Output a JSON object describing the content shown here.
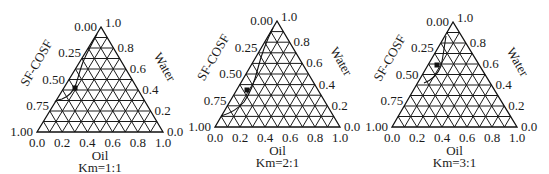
{
  "chart_data": [
    {
      "type": "ternary",
      "title": "Km=1:1",
      "axes": {
        "left": "SF-COSF",
        "right": "Water",
        "bottom": "Oil"
      },
      "ticks": {
        "left": [
          "0.00",
          "0.25",
          "0.50",
          "0.75",
          "1.00"
        ],
        "right": [
          "1.0",
          "0.8",
          "0.6",
          "0.4",
          "0.2",
          "0.0"
        ],
        "bottom": [
          "0.0",
          "0.2",
          "0.4",
          "0.6",
          "0.8",
          "1.0"
        ]
      },
      "grid_divisions": 10,
      "marker": {
        "sf_cosf": 0.6,
        "water": 0.38,
        "oil": 0.02
      },
      "phase_boundary": "curve near left edge from apex to SF-COSF≈0.7"
    },
    {
      "type": "ternary",
      "title": "Km=2:1",
      "axes": {
        "left": "SF-COSF",
        "right": "Water",
        "bottom": "Oil"
      },
      "ticks": {
        "left": [
          "0.00",
          "0.25",
          "0.50",
          "0.75",
          "1.00"
        ],
        "right": [
          "1.0",
          "0.8",
          "0.6",
          "0.4",
          "0.2",
          "0.0"
        ],
        "bottom": [
          "0.0",
          "0.2",
          "0.4",
          "0.6",
          "0.8",
          "1.0"
        ]
      },
      "grid_divisions": 10,
      "marker": {
        "sf_cosf": 0.58,
        "water": 0.36,
        "oil": 0.06
      },
      "phase_boundary": "curve from apex to SF-COSF≈0.9"
    },
    {
      "type": "ternary",
      "title": "Km=3:1",
      "axes": {
        "left": "SF-COSF",
        "right": "Water",
        "bottom": "Oil"
      },
      "ticks": {
        "left": [
          "0.00",
          "0.25",
          "0.50",
          "0.75",
          "1.00"
        ],
        "right": [
          "1.0",
          "0.8",
          "0.6",
          "0.4",
          "0.2",
          "0.0"
        ],
        "bottom": [
          "0.0",
          "0.2",
          "0.4",
          "0.6",
          "0.8",
          "1.0"
        ]
      },
      "grid_divisions": 10,
      "marker": {
        "sf_cosf": 0.38,
        "water": 0.58,
        "oil": 0.04
      },
      "phase_boundary": "short arc near left edge between SF-COSF≈0.2 and ≈0.45"
    }
  ],
  "diagrams": [
    {
      "title": "Km=1:1",
      "bottom_label": "Oil",
      "left_label": "SF-COSF",
      "right_label": "Water",
      "apex": [
        101,
        27
      ],
      "bl": [
        37,
        132
      ],
      "br": [
        163,
        132
      ],
      "curve": "M 97 34 C 92 44, 86 54, 83 62 C 80 70, 78 78, 76 84 C 73 92, 68 97, 62 99 C 58 100, 56 100, 55 102",
      "marker": [
        75,
        88
      ]
    },
    {
      "title": "Km=2:1",
      "bottom_label": "Oil",
      "left_label": "SF-COSF",
      "right_label": "Water",
      "apex": [
        277,
        21
      ],
      "bl": [
        215,
        127
      ],
      "br": [
        340,
        127
      ],
      "curve": "M 273 28 C 266 42, 261 56, 258 68 C 255 80, 251 92, 244 102 C 237 110, 228 114, 221 116",
      "marker": [
        247,
        90
      ]
    },
    {
      "title": "Km=3:1",
      "bottom_label": "Oil",
      "left_label": "SF-COSF",
      "right_label": "Water",
      "apex": [
        453,
        22
      ],
      "bl": [
        392,
        127
      ],
      "br": [
        517,
        127
      ],
      "curve": "M 446 36 C 444 48, 443 58, 441 66 C 438 74, 432 80, 424 83",
      "marker": [
        437,
        65
      ]
    }
  ]
}
